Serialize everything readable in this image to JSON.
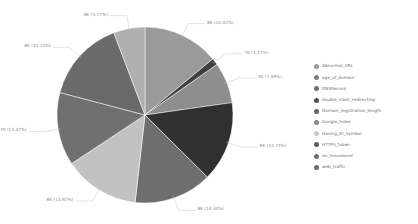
{
  "chart_data": {
    "type": "pie",
    "title": "",
    "legend_position": "right",
    "value_label_format": "{value} ({percent}%)",
    "categories": [
      "Abnormal_URL",
      "age_of_domain",
      "DNSRecord",
      "double_slash_redirecting",
      "Domain_registration_length",
      "Google_Index",
      "Having_At_Symbol",
      "HTTPS_token",
      "on_mouseover",
      "web_traffic"
    ],
    "percents": [
      14.02,
      1.27,
      7.49,
      14.74,
      14.34,
      13.92,
      13.42,
      15.15,
      5.77,
      0.0
    ],
    "slices": [
      {
        "label": "Abnormal_URL",
        "percent": 14.02,
        "value_label": "8K (14.02%)",
        "color": "#9a9a9a"
      },
      {
        "label": "age_of_domain",
        "percent": 1.27,
        "value_label": "7K (1.27%)",
        "color": "#3f3f3f"
      },
      {
        "label": "DNSRecord",
        "percent": 7.49,
        "value_label": "4K (7.49%)",
        "color": "#8e8e8e"
      },
      {
        "label": "double_slash_redirecting",
        "percent": 14.74,
        "value_label": "8K (14.74%)",
        "color": "#303030"
      },
      {
        "label": "Domain_registration_length",
        "percent": 14.34,
        "value_label": "8K (14.34%)",
        "color": "#6e6e6e"
      },
      {
        "label": "Google_Index",
        "percent": 13.92,
        "value_label": "8K (13.92%)",
        "color": "#c2c2c2"
      },
      {
        "label": "Having_At_Symbol",
        "percent": 13.42,
        "value_label": "7K (13.42%)",
        "color": "#707070"
      },
      {
        "label": "HTTPS_token",
        "percent": 15.15,
        "value_label": "8K (15.15%)",
        "color": "#6a6a6a"
      },
      {
        "label": "on_mouseover",
        "percent": 5.77,
        "value_label": "8K (5.77%)",
        "color": "#b0b0b0"
      },
      {
        "label": "web_traffic",
        "percent": 0.0,
        "value_label": "",
        "color": "#585858"
      }
    ],
    "legend": [
      {
        "label": "Abnormal_URL",
        "color": "#9a9a9a"
      },
      {
        "label": "age_of_domain",
        "color": "#7d7d7d"
      },
      {
        "label": "DNSRecord",
        "color": "#6e6e6e"
      },
      {
        "label": "double_slash_redirecting",
        "color": "#4f4f4f"
      },
      {
        "label": "Domain_registration_length",
        "color": "#636363"
      },
      {
        "label": "Google_Index",
        "color": "#8a8a8a"
      },
      {
        "label": "Having_At_Symbol",
        "color": "#c9c9c9"
      },
      {
        "label": "HTTPS_token",
        "color": "#5d5d5d"
      },
      {
        "label": "on_mouseover",
        "color": "#707070"
      },
      {
        "label": "web_traffic",
        "color": "#6a6a6a"
      }
    ],
    "geometry": {
      "center_x": 145,
      "center_y": 115,
      "radius": 88,
      "start_angle_deg": -90,
      "direction": "clockwise"
    },
    "background": "#ffffff"
  }
}
